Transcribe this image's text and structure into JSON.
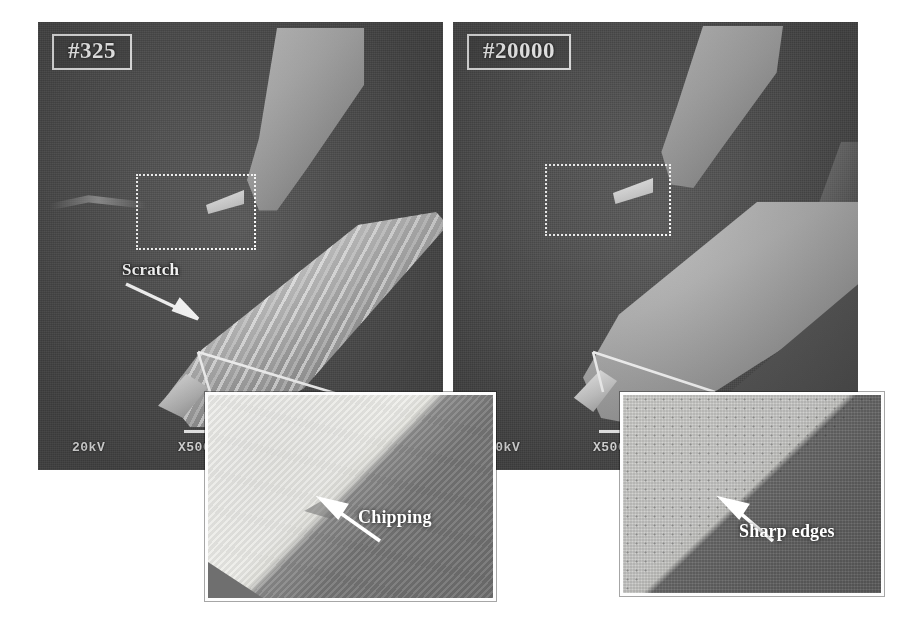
{
  "figure": {
    "type": "sem-micrograph-comparison",
    "panel_count": 2,
    "inset_count": 2
  },
  "panels": [
    {
      "id": "left",
      "tag_label": "#325",
      "condition_note": "worn tool with scratches and chipping",
      "scale": {
        "voltage": "20kV",
        "magnification": "X500",
        "bar_length": "50",
        "bar_unit": ""
      },
      "roi": {
        "name": "tool-tip-region"
      },
      "annotation": {
        "label": "Scratch"
      }
    },
    {
      "id": "right",
      "tag_label": "#20000",
      "condition_note": "tool with sharp intact edges",
      "scale": {
        "voltage": "20kV",
        "magnification": "X500",
        "bar_length": "",
        "bar_unit": ""
      },
      "roi": {
        "name": "tool-tip-region"
      },
      "annotation": {
        "label": ""
      }
    }
  ],
  "insets": [
    {
      "id": "left-inset",
      "parent_panel": "#325",
      "label": "Chipping",
      "arrow_direction": "up-left"
    },
    {
      "id": "right-inset",
      "parent_panel": "#20000",
      "label": "Sharp edges",
      "arrow_direction": "up-left"
    }
  ],
  "colors": {
    "background": "#ffffff",
    "panel_base": "#4c4c4c",
    "annotation_text": "#ffffff",
    "border": "#fdfdfd"
  }
}
